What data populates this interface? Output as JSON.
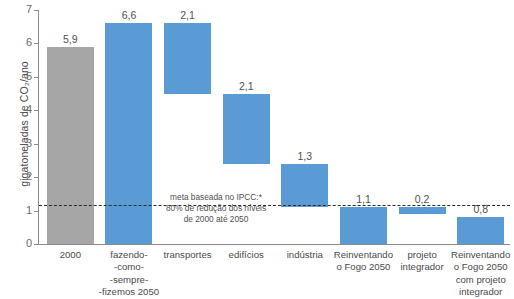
{
  "chart_data": {
    "type": "bar",
    "subtype": "waterfall",
    "title": "",
    "xlabel": "",
    "ylabel": "gigatoneladas de CO₂/ano",
    "ylim": [
      0,
      7
    ],
    "yticks": [
      0,
      1,
      2,
      3,
      4,
      5,
      6,
      7
    ],
    "ytick_labels": [
      "0",
      "1",
      "2",
      "3",
      "4",
      "5",
      "6",
      "7"
    ],
    "grid": false,
    "legend": null,
    "categories": [
      "2000",
      "fazendo-\n-como-\n-sempre-\n-fizemos 2050",
      "transportes",
      "edifícios",
      "indústria",
      "Reinventando\no Fogo 2050",
      "projeto\nintegrador",
      "Reinventando\no Fogo 2050\ncom projeto\nintegrador"
    ],
    "values": [
      5.9,
      6.6,
      2.1,
      2.1,
      1.3,
      1.1,
      0.2,
      0.8
    ],
    "value_labels": [
      "5,9",
      "6,6",
      "2,1",
      "2,1",
      "1,3",
      "1,1",
      "0,2",
      "0,8"
    ],
    "bar_bases": [
      0.0,
      0.0,
      4.5,
      2.4,
      1.1,
      0.0,
      0.9,
      0.0
    ],
    "bar_tops": [
      5.9,
      6.6,
      6.6,
      4.5,
      2.4,
      1.1,
      1.1,
      0.8
    ],
    "bar_colors": [
      "#a6a6a6",
      "#5b9bd5",
      "#5b9bd5",
      "#5b9bd5",
      "#5b9bd5",
      "#5b9bd5",
      "#5b9bd5",
      "#5b9bd5"
    ],
    "annotations": [
      {
        "name": "ipcc-target-line",
        "type": "hline",
        "y": 1.17,
        "style": "dashed",
        "color": "#2b2b2b",
        "text_lines": [
          "meta baseada no IPCC:*",
          "80% de redução dos níveis",
          "de 2000 até 2050"
        ]
      }
    ]
  },
  "axis": {
    "y_title": "gigatoneladas de CO₂/ano",
    "ticks": [
      "7",
      "6",
      "5",
      "4",
      "3",
      "2",
      "1",
      "0"
    ]
  },
  "bars": [
    {
      "value_label": "5,9",
      "category_lines": [
        "2000"
      ]
    },
    {
      "value_label": "6,6",
      "category_lines": [
        "fazendo-",
        "-como-",
        "-sempre-",
        "-fizemos 2050"
      ]
    },
    {
      "value_label": "2,1",
      "category_lines": [
        "transportes"
      ]
    },
    {
      "value_label": "2,1",
      "category_lines": [
        "edifícios"
      ]
    },
    {
      "value_label": "1,3",
      "category_lines": [
        "indústria"
      ]
    },
    {
      "value_label": "1,1",
      "category_lines": [
        "Reinventando",
        "o Fogo 2050"
      ]
    },
    {
      "value_label": "0,2",
      "category_lines": [
        "projeto",
        "integrador"
      ]
    },
    {
      "value_label": "0,8",
      "category_lines": [
        "Reinventando",
        "o Fogo 2050",
        "com projeto",
        "integrador"
      ]
    }
  ],
  "target_note": {
    "line1": "meta baseada no IPCC:*",
    "line2": "80% de redução dos níveis",
    "line3": "de 2000 até 2050"
  },
  "colors": {
    "blue": "#5b9bd5",
    "gray": "#a6a6a6",
    "axis": "#8a8a8a",
    "text": "#4a4a4a",
    "dash": "#2b2b2b"
  }
}
